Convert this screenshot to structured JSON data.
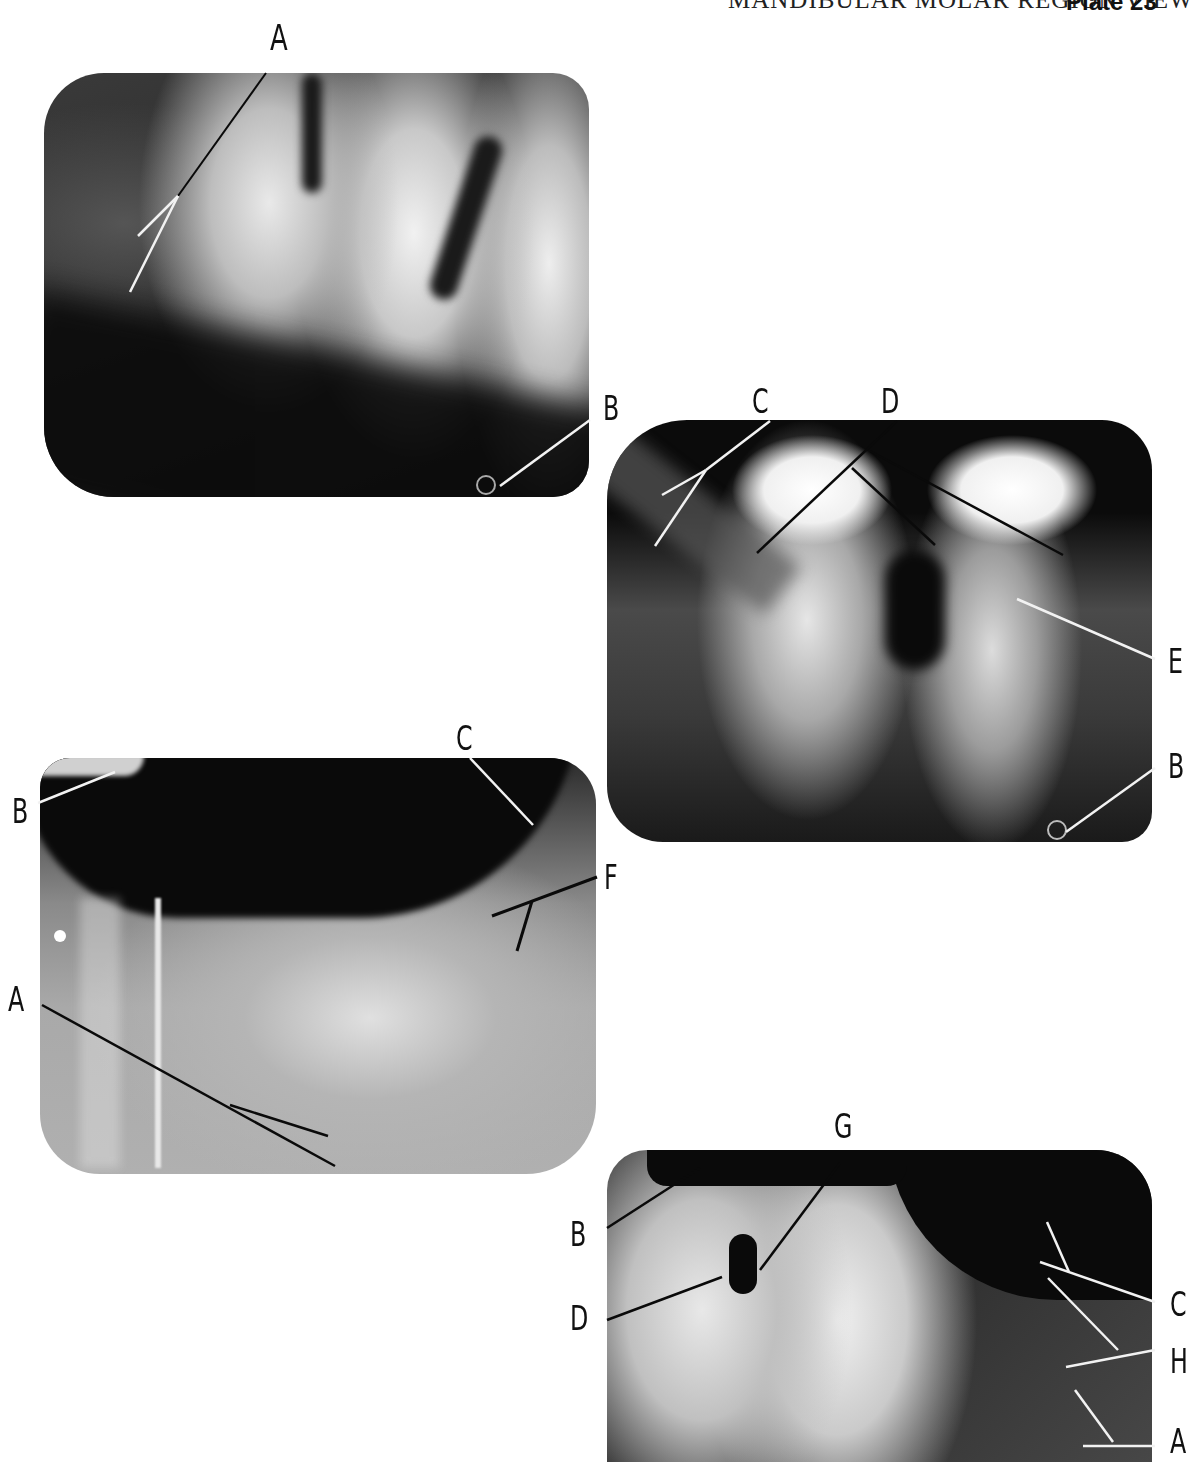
{
  "header": {
    "title": "MANDIBULAR MOLAR REGION VIEW",
    "plate": "Plate 23"
  },
  "panels": [
    {
      "id": "top-left",
      "labels": [
        "A",
        "B"
      ]
    },
    {
      "id": "middle-right",
      "labels": [
        "C",
        "D",
        "E",
        "B"
      ]
    },
    {
      "id": "middle-left",
      "labels": [
        "B",
        "C",
        "F",
        "A"
      ]
    },
    {
      "id": "bottom-right",
      "labels": [
        "G",
        "B",
        "D",
        "C",
        "H",
        "A"
      ]
    }
  ],
  "colors": {
    "leader_light": "#f2f2f2",
    "leader_dark": "#0a0a0a",
    "film_dark": "#111111"
  }
}
